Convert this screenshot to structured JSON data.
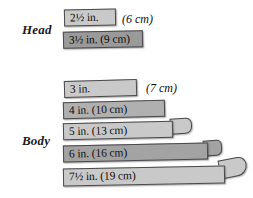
{
  "figure": {
    "background": "#ffffff",
    "tones": {
      "light": "#c9c9c9",
      "mid": "#b0b0b0",
      "dark": "#9a9a9a",
      "textured": "#a3a3a3",
      "outline": "#4a4a4a",
      "text": "#111111"
    }
  },
  "groups": [
    {
      "label": "Head",
      "strips": [
        {
          "inches_label": "2½ in.",
          "cm_label": "(6 cm)",
          "cm_inside": false,
          "inches_value": 2.5,
          "cm_value": 6,
          "tone": "light"
        },
        {
          "inches_label": "3½ in.",
          "cm_label": "(9 cm)",
          "cm_inside": true,
          "inches_value": 3.5,
          "cm_value": 9,
          "tone": "dark"
        }
      ]
    },
    {
      "label": "Body",
      "strips": [
        {
          "inches_label": "3 in.",
          "cm_label": "(7 cm)",
          "cm_inside": false,
          "inches_value": 3,
          "cm_value": 7,
          "tone": "light"
        },
        {
          "inches_label": "4 in.",
          "cm_label": "(10 cm)",
          "cm_inside": true,
          "inches_value": 4,
          "cm_value": 10,
          "tone": "mid"
        },
        {
          "inches_label": "5 in.",
          "cm_label": "(13 cm)",
          "cm_inside": true,
          "inches_value": 5,
          "cm_value": 13,
          "tone": "light"
        },
        {
          "inches_label": "6 in.",
          "cm_label": "(16 cm)",
          "cm_inside": true,
          "inches_value": 6,
          "cm_value": 16,
          "tone": "textured"
        },
        {
          "inches_label": "7½ in.",
          "cm_label": "(19 cm)",
          "cm_inside": true,
          "inches_value": 7.5,
          "cm_value": 19,
          "tone": "light"
        }
      ]
    }
  ],
  "head": {
    "label": "Head",
    "strip1_text": "2½ in.",
    "strip1_cm": "(6 cm)",
    "strip2_text": "3½ in. (9 cm)"
  },
  "body": {
    "label": "Body",
    "strip1_text": "3 in.",
    "strip1_cm": "(7 cm)",
    "strip2_text": "4 in. (10 cm)",
    "strip3_text": "5 in.  (13 cm)",
    "strip4_text": "6 in.  (16 cm)",
    "strip5_text": "7½ in.  (19 cm)"
  }
}
